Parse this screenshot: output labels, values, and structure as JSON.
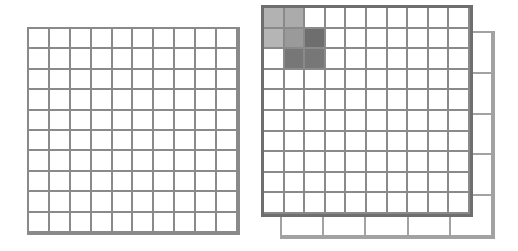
{
  "diagram": {
    "left_grid": {
      "rows": 10,
      "cols": 10,
      "line_color": "#8a8a8a"
    },
    "right_front_grid": {
      "rows": 10,
      "cols": 10,
      "line_color": "#8a8a8a",
      "border_color": "#6e6e6e",
      "shaded_cells": [
        {
          "row": 0,
          "col": 0,
          "color": "#b2b2b2"
        },
        {
          "row": 0,
          "col": 1,
          "color": "#ababab"
        },
        {
          "row": 1,
          "col": 0,
          "color": "#b5b5b5"
        },
        {
          "row": 1,
          "col": 1,
          "color": "#9a9a9a"
        },
        {
          "row": 1,
          "col": 2,
          "color": "#6e6e6e"
        },
        {
          "row": 2,
          "col": 1,
          "color": "#777777"
        },
        {
          "row": 2,
          "col": 2,
          "color": "#777777"
        }
      ]
    },
    "right_back_grid": {
      "rows": 5,
      "cols": 5,
      "line_color": "#a2a2a2"
    }
  }
}
